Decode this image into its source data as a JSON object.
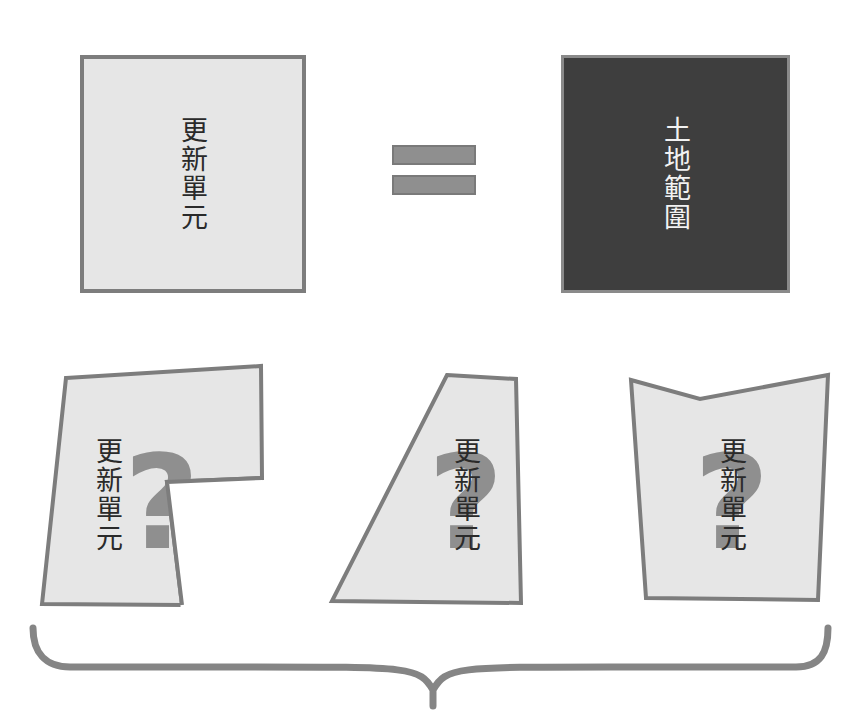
{
  "top_row": {
    "left_box": {
      "label": "更新單元",
      "fill": "#e6e6e6",
      "border": "#7d7d7d",
      "text_color": "#2a2a2a"
    },
    "operator": {
      "symbol": "=",
      "color": "#8f8f8f"
    },
    "right_box": {
      "label": "土地範圍",
      "fill": "#3e3e3e",
      "border": "#8a8a8a",
      "text_color": "#f2f2f2"
    }
  },
  "bottom_row": {
    "shapes": [
      {
        "label": "更新單元",
        "mark": "?",
        "shape": "irregular-L"
      },
      {
        "label": "更新單元",
        "mark": "?",
        "shape": "trapezoid"
      },
      {
        "label": "更新單元",
        "mark": "?",
        "shape": "notched-top"
      }
    ],
    "fill": "#e6e6e6",
    "border": "#7d7d7d",
    "mark_color": "#8f8f8f"
  },
  "brace": {
    "orientation": "down",
    "color": "#858585"
  }
}
